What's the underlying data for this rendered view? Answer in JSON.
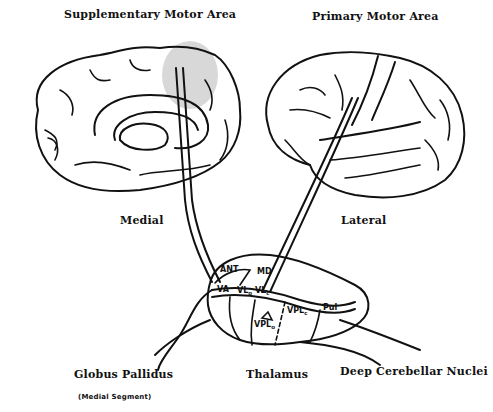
{
  "labels": {
    "supplementary_motor_area": "Supplementary Motor Area",
    "primary_motor_area": "Primary Motor Area",
    "medial": "Medial",
    "lateral": "Lateral",
    "globus_pallidus": "Globus Pallidus",
    "globus_pallidus_sub": "(Medial Segment)",
    "thalamus": "Thalamus",
    "deep_cerebellar_nuclei": "Deep Cerebellar Nuclei"
  },
  "thalamic_nuclei": {
    "ant": "ANT",
    "md": "MD",
    "va": "VA",
    "vlo": {
      "main": "VL",
      "sub": "o"
    },
    "vlc": {
      "main": "VL",
      "sub": "c"
    },
    "vplc": {
      "main": "VPL",
      "sub": "c"
    },
    "vplo": {
      "main": "VPL",
      "sub": "o"
    },
    "pul": "Pul"
  },
  "colors": {
    "line": "#111111",
    "sma_highlight": "#d8d8d8",
    "background": "#ffffff"
  }
}
